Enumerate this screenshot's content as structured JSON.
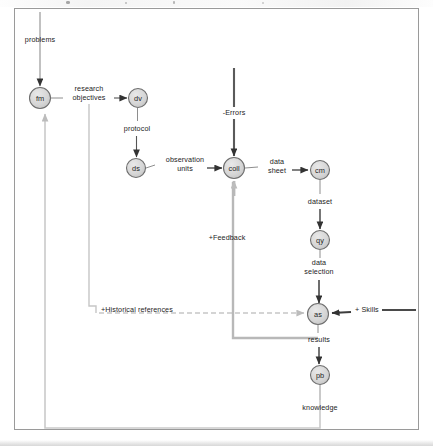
{
  "diagram": {
    "type": "process-flow-diagram",
    "nodes": [
      {
        "id": "fm",
        "label": "fm",
        "cx": 40,
        "cy": 98,
        "r": 10.5
      },
      {
        "id": "dv",
        "label": "dv",
        "cx": 138,
        "cy": 98,
        "r": 9.5
      },
      {
        "id": "ds",
        "label": "ds",
        "cx": 136,
        "cy": 168,
        "r": 9.5
      },
      {
        "id": "coll",
        "label": "coll",
        "cx": 234,
        "cy": 168,
        "r": 10.5
      },
      {
        "id": "cm",
        "label": "cm",
        "cx": 320,
        "cy": 170,
        "r": 9.5
      },
      {
        "id": "qy",
        "label": "qy",
        "cx": 320,
        "cy": 240,
        "r": 9.5
      },
      {
        "id": "as",
        "label": "as",
        "cx": 318,
        "cy": 314,
        "r": 10.5
      },
      {
        "id": "pb",
        "label": "pb",
        "cx": 320,
        "cy": 375,
        "r": 9.5
      }
    ],
    "edge_labels": [
      {
        "name": "problems",
        "text": "problems",
        "x": 40,
        "y": 40,
        "align": "center"
      },
      {
        "name": "research-objectives",
        "text": "research\nobjectives",
        "x": 89,
        "y": 90,
        "align": "center"
      },
      {
        "name": "protocol",
        "text": "protocol",
        "x": 137,
        "y": 129,
        "align": "center"
      },
      {
        "name": "observation-units",
        "text": "observation\nunits",
        "x": 185,
        "y": 160,
        "align": "center"
      },
      {
        "name": "errors",
        "text": "-Errors",
        "x": 234,
        "y": 113,
        "align": "center"
      },
      {
        "name": "data-sheet",
        "text": "data\nsheet",
        "x": 277,
        "y": 162,
        "align": "center"
      },
      {
        "name": "dataset",
        "text": "dataset",
        "x": 320,
        "y": 202,
        "align": "center"
      },
      {
        "name": "data-selection",
        "text": "data\nselection",
        "x": 319,
        "y": 266,
        "align": "center"
      },
      {
        "name": "feedback",
        "text": "+Feedback",
        "x": 227,
        "y": 238,
        "align": "center"
      },
      {
        "name": "historical-references",
        "text": "+Historical references",
        "x": 101,
        "y": 310,
        "align": "left"
      },
      {
        "name": "skills",
        "text": "+ Skills",
        "x": 355,
        "y": 310,
        "align": "left"
      },
      {
        "name": "results",
        "text": "results",
        "x": 319,
        "y": 340,
        "align": "center"
      },
      {
        "name": "knowledge",
        "text": "knowledge",
        "x": 320,
        "y": 408,
        "align": "center"
      }
    ],
    "colors": {
      "node_fill": "#d6d6d6",
      "node_stroke": "#6e6e6e",
      "dark_edge": "#3a3a3a",
      "light_edge": "#c2c2c2",
      "border": "#9a9a9a",
      "text": "#1c1c1c"
    }
  }
}
